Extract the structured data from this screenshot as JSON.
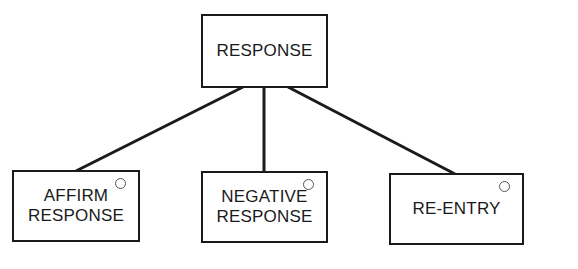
{
  "diagram": {
    "type": "tree",
    "root": {
      "id": "response",
      "lines": [
        "RESPONSE"
      ]
    },
    "children": [
      {
        "id": "affirm",
        "lines": [
          "AFFIRM",
          "RESPONSE"
        ],
        "marker": "circle"
      },
      {
        "id": "negative",
        "lines": [
          "NEGATIVE",
          "RESPONSE"
        ],
        "marker": "circle"
      },
      {
        "id": "reentry",
        "lines": [
          "RE-ENTRY"
        ],
        "marker": "circle"
      }
    ],
    "edges": [
      {
        "from": "response",
        "to": "affirm"
      },
      {
        "from": "response",
        "to": "negative"
      },
      {
        "from": "response",
        "to": "reentry"
      }
    ],
    "line_color": "#1a1a1a"
  }
}
